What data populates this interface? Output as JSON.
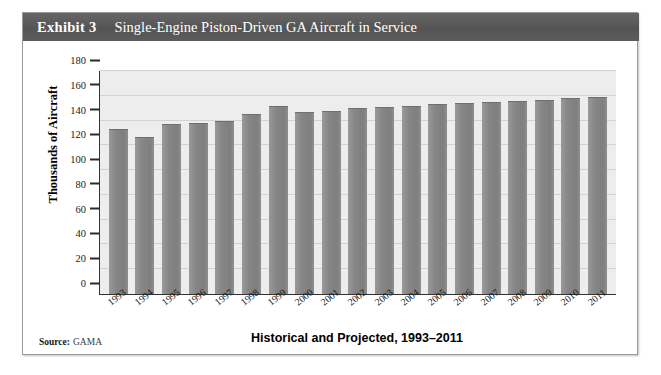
{
  "exhibit": {
    "label": "Exhibit 3",
    "title": "Single-Engine Piston-Driven GA Aircraft in Service",
    "source_label": "Source:",
    "source_value": "GAMA",
    "header_color": "#595959",
    "bar_color": "#8d8d8d",
    "plot_background": "#ededed",
    "gridline_color": "#d3d3d3"
  },
  "chart_data": {
    "type": "bar",
    "title": "Single-Engine Piston-Driven GA Aircraft in Service",
    "xlabel": "Historical and Projected, 1993–2011",
    "ylabel": "Thousands of Aircraft",
    "categories": [
      "1993",
      "1994",
      "1995",
      "1996",
      "1997",
      "1998",
      "1999",
      "2000",
      "2001",
      "2002",
      "2003",
      "2004",
      "2005",
      "2006",
      "2007",
      "2008",
      "2009",
      "2010",
      "2011"
    ],
    "values": [
      133,
      127,
      137,
      138,
      140,
      145,
      152,
      147,
      148,
      150,
      151,
      152,
      153,
      154,
      155,
      156,
      157,
      158,
      159
    ],
    "ylim": [
      0,
      180
    ],
    "yticks": [
      0,
      20,
      40,
      60,
      80,
      100,
      120,
      140,
      160,
      180
    ],
    "ytick_labels": [
      "0",
      "20",
      "40",
      "60",
      "80",
      "100",
      "120",
      "140",
      "160",
      "180"
    ],
    "grid": true,
    "legend": null
  }
}
